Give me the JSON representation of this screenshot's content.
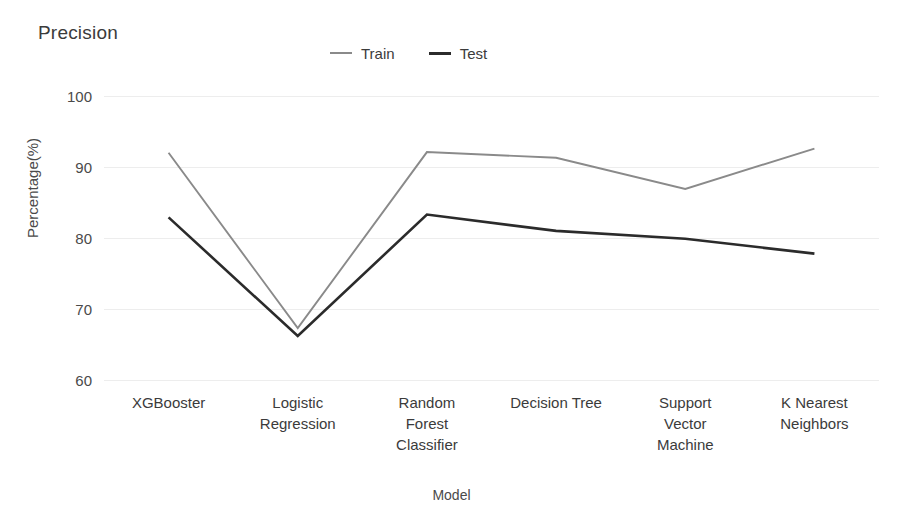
{
  "chart_data": {
    "type": "line",
    "title": "Precision",
    "xlabel": "Model",
    "ylabel": "Percentage(%)",
    "categories": [
      "XGBooster",
      "Logistic Regression",
      "Random Forest Classifier",
      "Decision Tree",
      "Support Vector Machine",
      "K Nearest Neighbors"
    ],
    "category_lines": [
      [
        "XGBooster"
      ],
      [
        "Logistic",
        "Regression"
      ],
      [
        "Random",
        "Forest",
        "Classifier"
      ],
      [
        "Decision Tree"
      ],
      [
        "Support",
        "Vector",
        "Machine"
      ],
      [
        "K Nearest",
        "Neighbors"
      ]
    ],
    "series": [
      {
        "name": "Train",
        "color": "#8a8a8a",
        "values": [
          92.0,
          67.3,
          92.1,
          91.3,
          86.9,
          92.6
        ]
      },
      {
        "name": "Test",
        "color": "#2b2b2b",
        "values": [
          82.9,
          66.2,
          83.3,
          81.0,
          79.9,
          77.8
        ]
      }
    ],
    "ylim": [
      60,
      100
    ],
    "yticks": [
      100,
      90,
      80,
      70,
      60
    ],
    "ytick_labels": [
      "100",
      "90",
      "80",
      "70",
      "60"
    ],
    "grid": true,
    "grid_color": "#ededed",
    "legend_position": "top-center",
    "background": "#ffffff"
  },
  "legend": {
    "entries": [
      {
        "label": "Train",
        "swatch": "train-line-swatch"
      },
      {
        "label": "Test",
        "swatch": "test-line-swatch"
      }
    ]
  }
}
